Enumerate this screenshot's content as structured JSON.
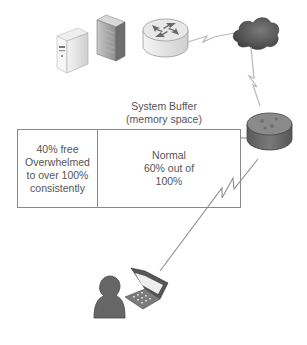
{
  "diagram": {
    "buffer": {
      "title_line1": "System Buffer",
      "title_line2": "(memory space)",
      "left_cell": {
        "lines": [
          "40% free",
          "Overwhelmed",
          "to over 100%",
          "consistently"
        ]
      },
      "right_cell": {
        "lines": [
          "Normal",
          "60% out of",
          "100%"
        ]
      }
    },
    "nodes": [
      {
        "id": "server",
        "icon": "server-tower-icon"
      },
      {
        "id": "firewall",
        "icon": "firewall-icon"
      },
      {
        "id": "router-top",
        "icon": "router-icon"
      },
      {
        "id": "internet-cloud",
        "icon": "cloud-icon"
      },
      {
        "id": "router-dark",
        "icon": "router-dark-icon"
      },
      {
        "id": "user",
        "icon": "user-icon"
      },
      {
        "id": "laptop",
        "icon": "laptop-icon"
      }
    ],
    "links": [
      {
        "from": "router-top",
        "to": "internet-cloud",
        "type": "wan-lightning"
      },
      {
        "from": "internet-cloud",
        "to": "router-dark",
        "type": "wan-lightning"
      },
      {
        "from": "router-dark",
        "to": "laptop",
        "type": "wan-lightning"
      },
      {
        "from": "buffer",
        "to": "router-dark",
        "type": "line"
      }
    ],
    "colors": {
      "text": "#555555",
      "border": "#8a8a8a",
      "dark_device": "#6b6b6b",
      "light_device": "#e4e4e4"
    }
  }
}
